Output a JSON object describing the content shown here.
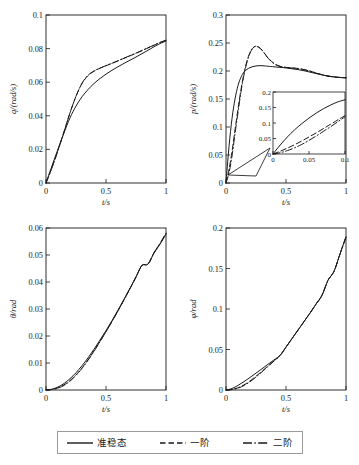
{
  "figure": {
    "title": "",
    "panels": [
      "q-panel",
      "p-panel",
      "theta-panel",
      "phi-panel"
    ]
  },
  "legend": {
    "items": [
      {
        "label": "准稳态",
        "style": "solid",
        "name": "legend-item-quasi-steady"
      },
      {
        "label": "一阶",
        "style": "dashed",
        "name": "legend-item-first-order"
      },
      {
        "label": "二阶",
        "style": "dashdot",
        "name": "legend-item-second-order"
      }
    ]
  },
  "chart_data": [
    {
      "type": "line",
      "id": "q-panel",
      "title": "",
      "xlabel": "t/s",
      "ylabel": "q/(rad/s)",
      "xlim": [
        0,
        1
      ],
      "ylim": [
        0,
        0.1
      ],
      "xticks": [
        0,
        0.5,
        1
      ],
      "xticklabels": [
        "0",
        "0.5",
        "1"
      ],
      "yticks": [
        0,
        0.02,
        0.04,
        0.06,
        0.08,
        0.1
      ],
      "yticklabels": [
        "0",
        "0.02",
        "0.04",
        "0.06",
        "0.08",
        "0.1"
      ],
      "grid": false,
      "legend_position": "figure-bottom",
      "x": [
        0,
        0.05,
        0.1,
        0.15,
        0.2,
        0.25,
        0.3,
        0.35,
        0.4,
        0.45,
        0.5,
        0.55,
        0.6,
        0.65,
        0.7,
        0.75,
        0.8,
        0.85,
        0.9,
        0.95,
        1
      ],
      "series": [
        {
          "name": "准稳态",
          "style": "solid",
          "values": [
            0,
            0.0102,
            0.0202,
            0.0298,
            0.0388,
            0.0458,
            0.0513,
            0.0556,
            0.0592,
            0.0622,
            0.0648,
            0.0671,
            0.0692,
            0.0712,
            0.0731,
            0.075,
            0.077,
            0.079,
            0.0811,
            0.083,
            0.0845
          ]
        },
        {
          "name": "一阶",
          "style": "dashed",
          "values": [
            0,
            0.0093,
            0.0196,
            0.0306,
            0.0418,
            0.0516,
            0.0592,
            0.0639,
            0.0665,
            0.0683,
            0.0698,
            0.0712,
            0.0727,
            0.0742,
            0.0757,
            0.0772,
            0.0788,
            0.0804,
            0.082,
            0.0836,
            0.0849
          ]
        },
        {
          "name": "二阶",
          "style": "dashdot",
          "values": [
            0,
            0.009,
            0.0193,
            0.0304,
            0.0417,
            0.0517,
            0.0594,
            0.0641,
            0.0667,
            0.0684,
            0.0699,
            0.0713,
            0.0728,
            0.0743,
            0.0758,
            0.0773,
            0.0789,
            0.0805,
            0.0821,
            0.0837,
            0.085
          ]
        }
      ]
    },
    {
      "type": "line",
      "id": "p-panel",
      "title": "",
      "xlabel": "t/s",
      "ylabel": "p/(rad/s)",
      "xlim": [
        0,
        1
      ],
      "ylim": [
        0,
        0.3
      ],
      "xticks": [
        0,
        0.5,
        1
      ],
      "xticklabels": [
        "0",
        "0.5",
        "1"
      ],
      "yticks": [
        0,
        0.05,
        0.1,
        0.15,
        0.2,
        0.25,
        0.3
      ],
      "yticklabels": [
        "0",
        "0.05",
        "0.1",
        "0.15",
        "0.2",
        "0.25",
        "0.3"
      ],
      "grid": false,
      "legend_position": "figure-bottom",
      "x": [
        0,
        0.025,
        0.05,
        0.075,
        0.1,
        0.125,
        0.15,
        0.175,
        0.2,
        0.225,
        0.25,
        0.275,
        0.3,
        0.325,
        0.35,
        0.4,
        0.45,
        0.5,
        0.55,
        0.6,
        0.65,
        0.7,
        0.75,
        0.8,
        0.85,
        0.9,
        0.95,
        1
      ],
      "series": [
        {
          "name": "准稳态",
          "style": "solid",
          "values": [
            0,
            0.065,
            0.115,
            0.15,
            0.174,
            0.189,
            0.198,
            0.203,
            0.206,
            0.208,
            0.209,
            0.2095,
            0.2095,
            0.209,
            0.2085,
            0.2075,
            0.2065,
            0.2055,
            0.204,
            0.2025,
            0.2005,
            0.198,
            0.1955,
            0.193,
            0.191,
            0.1895,
            0.1885,
            0.188
          ]
        },
        {
          "name": "一阶",
          "style": "dashed",
          "values": [
            0,
            0.024,
            0.056,
            0.095,
            0.132,
            0.167,
            0.196,
            0.218,
            0.233,
            0.2415,
            0.2445,
            0.2425,
            0.2375,
            0.2305,
            0.2235,
            0.2135,
            0.2085,
            0.2065,
            0.2055,
            0.2045,
            0.2025,
            0.2,
            0.1965,
            0.1935,
            0.191,
            0.1895,
            0.1885,
            0.188
          ]
        },
        {
          "name": "二阶",
          "style": "dashdot",
          "values": [
            0,
            0.018,
            0.048,
            0.088,
            0.126,
            0.163,
            0.193,
            0.216,
            0.232,
            0.241,
            0.244,
            0.242,
            0.237,
            0.23,
            0.223,
            0.213,
            0.2082,
            0.2063,
            0.2053,
            0.2043,
            0.2023,
            0.1998,
            0.1963,
            0.1933,
            0.1908,
            0.1893,
            0.1883,
            0.1878
          ]
        }
      ],
      "inset": {
        "xlabel": "",
        "ylabel": "",
        "xlim": [
          0,
          0.1
        ],
        "ylim": [
          0,
          0.2
        ],
        "xticks": [
          0,
          0.05,
          0.1
        ],
        "xticklabels": [
          "0",
          "0.05",
          "0.1"
        ],
        "yticks": [
          0,
          0.05,
          0.1,
          0.15,
          0.2
        ],
        "yticklabels": [
          "0",
          "0.05",
          "0.1",
          "0.15",
          "0.2"
        ],
        "x": [
          0,
          0.01,
          0.02,
          0.03,
          0.04,
          0.05,
          0.06,
          0.07,
          0.08,
          0.09,
          0.1
        ],
        "series": [
          {
            "name": "准稳态",
            "style": "solid",
            "values": [
              0,
              0.029,
              0.055,
              0.078,
              0.098,
              0.116,
              0.132,
              0.146,
              0.158,
              0.168,
              0.175
            ]
          },
          {
            "name": "一阶",
            "style": "dashed",
            "values": [
              0,
              0.009,
              0.019,
              0.03,
              0.042,
              0.055,
              0.068,
              0.082,
              0.096,
              0.11,
              0.124
            ]
          },
          {
            "name": "二阶",
            "style": "dashdot",
            "values": [
              0,
              0.004,
              0.011,
              0.02,
              0.031,
              0.044,
              0.058,
              0.073,
              0.088,
              0.104,
              0.12
            ]
          }
        ]
      }
    },
    {
      "type": "line",
      "id": "theta-panel",
      "title": "",
      "xlabel": "t/s",
      "ylabel": "θ/rad",
      "xlim": [
        0,
        1
      ],
      "ylim": [
        0,
        0.06
      ],
      "xticks": [
        0,
        0.5,
        1
      ],
      "xticklabels": [
        "0",
        "0.5",
        "1"
      ],
      "yticks": [
        0,
        0.01,
        0.02,
        0.03,
        0.04,
        0.05,
        0.06
      ],
      "yticklabels": [
        "0",
        "0.01",
        "0.02",
        "0.03",
        "0.04",
        "0.05",
        "0.06"
      ],
      "grid": false,
      "legend_position": "figure-bottom",
      "x": [
        0,
        0.05,
        0.1,
        0.15,
        0.2,
        0.25,
        0.3,
        0.35,
        0.4,
        0.45,
        0.5,
        0.55,
        0.6,
        0.65,
        0.7,
        0.75,
        0.8,
        0.85,
        0.9,
        0.95,
        1
      ],
      "series": [
        {
          "name": "准稳态",
          "style": "solid",
          "values": [
            0,
            0.0003,
            0.0011,
            0.0024,
            0.0042,
            0.0064,
            0.009,
            0.0119,
            0.0151,
            0.0185,
            0.022,
            0.0257,
            0.0296,
            0.0336,
            0.0377,
            0.0419,
            0.0462,
            0.0466,
            0.0507,
            0.054,
            0.0577
          ]
        },
        {
          "name": "一阶",
          "style": "dashed",
          "values": [
            0,
            0.0002,
            0.0008,
            0.0019,
            0.0035,
            0.0056,
            0.0082,
            0.0112,
            0.0145,
            0.018,
            0.0216,
            0.0254,
            0.0293,
            0.0334,
            0.0375,
            0.0418,
            0.0461,
            0.0466,
            0.0508,
            0.0542,
            0.058
          ]
        },
        {
          "name": "二阶",
          "style": "dashdot",
          "values": [
            0,
            0.0002,
            0.0007,
            0.0017,
            0.0033,
            0.0054,
            0.008,
            0.011,
            0.0143,
            0.0179,
            0.0216,
            0.0254,
            0.0293,
            0.0334,
            0.0376,
            0.0419,
            0.0462,
            0.0467,
            0.0509,
            0.0543,
            0.0581
          ]
        }
      ]
    },
    {
      "type": "line",
      "id": "phi-panel",
      "title": "",
      "xlabel": "t/s",
      "ylabel": "φ/rad",
      "xlim": [
        0,
        1
      ],
      "ylim": [
        0,
        0.2
      ],
      "xticks": [
        0,
        0.5,
        1
      ],
      "xticklabels": [
        "0",
        "0.5",
        "1"
      ],
      "yticks": [
        0,
        0.05,
        0.1,
        0.15,
        0.2
      ],
      "yticklabels": [
        "0",
        "0.05",
        "0.1",
        "0.15",
        "0.2"
      ],
      "grid": false,
      "legend_position": "figure-bottom",
      "x": [
        0,
        0.05,
        0.1,
        0.15,
        0.2,
        0.25,
        0.3,
        0.35,
        0.4,
        0.45,
        0.5,
        0.55,
        0.6,
        0.65,
        0.7,
        0.75,
        0.8,
        0.85,
        0.9,
        0.95,
        1
      ],
      "series": [
        {
          "name": "准稳态",
          "style": "solid",
          "values": [
            0,
            0.0018,
            0.0057,
            0.0104,
            0.0155,
            0.0208,
            0.0262,
            0.0317,
            0.0372,
            0.0427,
            0.053,
            0.0635,
            0.074,
            0.0845,
            0.095,
            0.106,
            0.117,
            0.1355,
            0.1465,
            0.168,
            0.189
          ]
        },
        {
          "name": "一阶",
          "style": "dashed",
          "values": [
            0,
            0.0007,
            0.0028,
            0.0064,
            0.0112,
            0.017,
            0.0232,
            0.0296,
            0.0361,
            0.0427,
            0.053,
            0.0635,
            0.074,
            0.0845,
            0.095,
            0.106,
            0.117,
            0.1355,
            0.1465,
            0.168,
            0.189
          ]
        },
        {
          "name": "二阶",
          "style": "dashdot",
          "values": [
            0,
            0.0005,
            0.0022,
            0.0055,
            0.0102,
            0.016,
            0.0224,
            0.029,
            0.0357,
            0.0424,
            0.0528,
            0.0634,
            0.0739,
            0.0844,
            0.0949,
            0.1059,
            0.1169,
            0.1354,
            0.1464,
            0.1679,
            0.1889
          ]
        }
      ]
    }
  ]
}
